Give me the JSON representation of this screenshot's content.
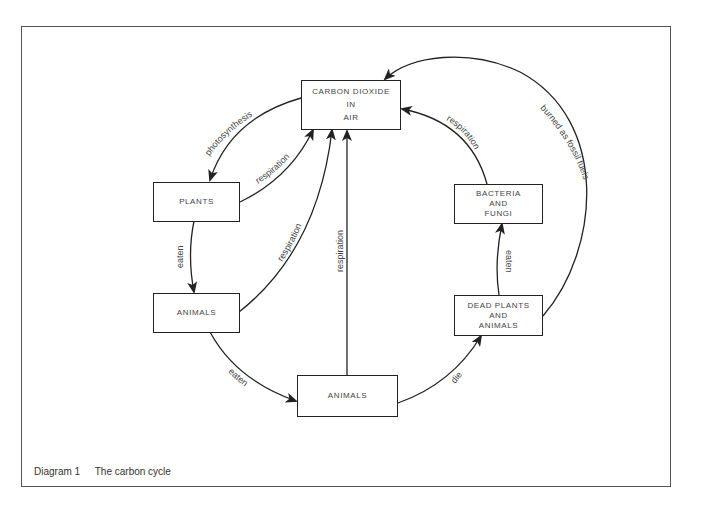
{
  "caption": {
    "number": "Diagram 1",
    "title": "The carbon cycle"
  },
  "nodes": {
    "co2": {
      "lines": [
        "CARBON DIOXIDE",
        "IN",
        "AIR"
      ]
    },
    "plants": {
      "lines": [
        "PLANTS"
      ]
    },
    "animals_left": {
      "lines": [
        "ANIMALS"
      ]
    },
    "animals_bottom": {
      "lines": [
        "ANIMALS"
      ]
    },
    "bacteria": {
      "lines": [
        "BACTERIA",
        "AND",
        "FUNGI"
      ]
    },
    "dead": {
      "lines": [
        "DEAD PLANTS",
        "AND",
        "ANIMALS"
      ]
    }
  },
  "edges": {
    "photosynthesis": "photosynthesis",
    "plants_resp": "respiration",
    "animals_left_resp": "respiration",
    "animals_bottom_resp": "respiration",
    "bacteria_resp": "respiration",
    "fossil": "burned as fossil fuels",
    "plants_eaten": "eaten",
    "animals_eaten": "eaten",
    "die": "die",
    "dead_eaten": "eaten"
  },
  "colors": {
    "line": "#222222",
    "text": "#444444",
    "frame": "#555555"
  }
}
